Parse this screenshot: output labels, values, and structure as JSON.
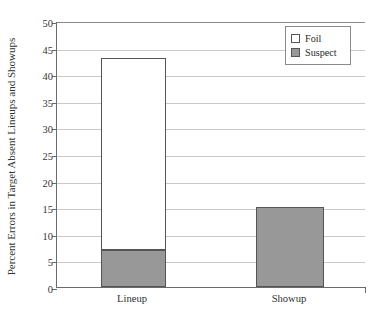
{
  "chart_data": {
    "type": "bar",
    "stacked": true,
    "title": "",
    "xlabel": "",
    "ylabel": "Percent Errors in Target Absent Lineups and Showups",
    "categories": [
      "Lineup",
      "Showup"
    ],
    "series": [
      {
        "name": "Suspect",
        "values": [
          7,
          15
        ],
        "color": "#989898"
      },
      {
        "name": "Foil",
        "values": [
          36,
          0
        ],
        "color": "#ffffff"
      }
    ],
    "stack_tops": [
      43,
      15
    ],
    "ylim": [
      0,
      50
    ],
    "ytick_step": 5,
    "yticks": [
      0,
      5,
      10,
      15,
      20,
      25,
      30,
      35,
      40,
      45,
      50
    ],
    "ytick_labels": [
      "0",
      "5",
      "10",
      "15",
      "20",
      "25",
      "30",
      "35",
      "40",
      "45",
      "50"
    ],
    "grid": true,
    "legend_position": "top-right-inside",
    "legend": [
      {
        "label": "Foil",
        "swatch": "#ffffff"
      },
      {
        "label": "Suspect",
        "swatch": "#989898"
      }
    ],
    "annotations": []
  },
  "axis": {
    "y_title": "Percent Errors in Target Absent Lineups and Showups",
    "ticks": [
      {
        "value": 50,
        "label": "50"
      },
      {
        "value": 45,
        "label": "45"
      },
      {
        "value": 40,
        "label": "40"
      },
      {
        "value": 35,
        "label": "35"
      },
      {
        "value": 30,
        "label": "30"
      },
      {
        "value": 25,
        "label": "25"
      },
      {
        "value": 20,
        "label": "20"
      },
      {
        "value": 15,
        "label": "15"
      },
      {
        "value": 10,
        "label": "10"
      },
      {
        "value": 5,
        "label": "5"
      },
      {
        "value": 0,
        "label": "0"
      }
    ]
  },
  "bars": [
    {
      "category": "Lineup",
      "foil_label": "Foil",
      "suspect_label": "Suspect",
      "suspect_value": 7,
      "total_value": 43
    },
    {
      "category": "Showup",
      "foil_label": "Foil",
      "suspect_label": "Suspect",
      "suspect_value": 15,
      "total_value": 15
    }
  ],
  "legend": {
    "foil": "Foil",
    "suspect": "Suspect"
  },
  "colors": {
    "suspect_fill": "#989898",
    "foil_fill": "#ffffff",
    "bar_outline": "#555555",
    "gridline": "#c9c9c9",
    "axis": "#6a6a6a"
  }
}
